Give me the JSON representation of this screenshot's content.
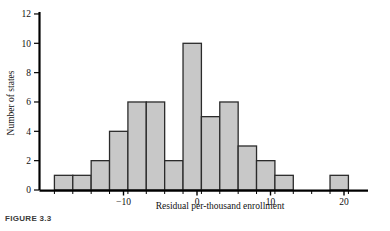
{
  "figure": {
    "caption": "FIGURE 3.3"
  },
  "chart_data": {
    "type": "bar",
    "title": "",
    "xlabel": "Residual per-thousand enrollment",
    "ylabel": "Number of states",
    "xlim": [
      -20.5,
      23.5
    ],
    "ylim": [
      0,
      12
    ],
    "xticks": [
      -10,
      0,
      10,
      20
    ],
    "xtick_labels": [
      "−10",
      "0",
      "10",
      "20"
    ],
    "yticks": [
      0,
      2,
      4,
      6,
      8,
      10,
      12
    ],
    "ytick_labels": [
      "0",
      "2",
      "4",
      "6",
      "8",
      "10",
      "12"
    ],
    "grid": false,
    "legend": null,
    "bin_width": 2.5,
    "bin_edges": [
      -19.4,
      -16.9,
      -14.4,
      -11.9,
      -9.4,
      -6.9,
      -4.4,
      -1.9,
      0.6,
      3.1,
      5.6,
      8.1,
      10.6,
      13.1,
      15.6,
      18.1,
      20.6
    ],
    "categories": [
      "-19.4 to -16.9",
      "-16.9 to -14.4",
      "-14.4 to -11.9",
      "-11.9 to -9.4",
      "-9.4 to -6.9",
      "-6.9 to -4.4",
      "-4.4 to -1.9",
      "-1.9 to 0.6",
      "0.6 to 3.1",
      "3.1 to 5.6",
      "5.6 to 8.1",
      "8.1 to 10.6",
      "10.6 to 13.1",
      "13.1 to 15.6",
      "15.6 to 18.1",
      "18.1 to 20.6"
    ],
    "values": [
      1,
      1,
      2,
      4,
      6,
      6,
      2,
      10,
      5,
      6,
      3,
      2,
      1,
      0,
      0,
      1
    ],
    "bar_fill": "#c8c8c8",
    "bar_edge": "#2b2b2b",
    "axis_color": "#000000"
  }
}
